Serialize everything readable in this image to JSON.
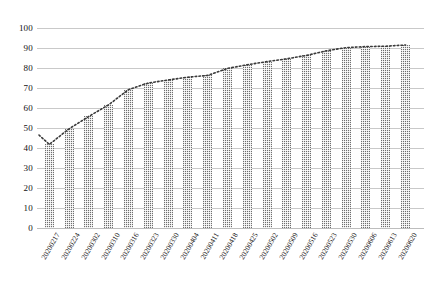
{
  "chart_data": {
    "type": "bar",
    "title": "",
    "subtitle": "",
    "xlabel": "",
    "ylabel": "",
    "ylim": [
      0,
      100
    ],
    "ytick_step": 10,
    "yticks": [
      0,
      10,
      20,
      30,
      40,
      50,
      60,
      70,
      80,
      90,
      100
    ],
    "grid": true,
    "legend": false,
    "legend_position": "none",
    "categories": [
      "20200217",
      "20200224",
      "20200302",
      "20200310",
      "20200316",
      "20200323",
      "20200330",
      "20200404",
      "20200411",
      "20200418",
      "20200425",
      "20200502",
      "20200509",
      "20200516",
      "20200523",
      "20200530",
      "20200606",
      "20200613",
      "20200620"
    ],
    "series": [
      {
        "name": "bars",
        "type": "bar",
        "values": [
          41.8,
          49.6,
          55.8,
          61.6,
          69.2,
          72.5,
          74.0,
          75.4,
          76.3,
          79.8,
          81.6,
          83.2,
          84.6,
          86.3,
          88.6,
          90.2,
          90.7,
          90.9,
          91.5
        ]
      },
      {
        "name": "trend",
        "type": "line",
        "style": "dotted",
        "values": [
          41.8,
          49.6,
          55.8,
          61.6,
          69.2,
          72.5,
          74.0,
          75.4,
          76.3,
          79.8,
          81.6,
          83.2,
          84.6,
          86.3,
          88.6,
          90.2,
          90.7,
          90.9,
          91.5
        ],
        "lead_in_value": 46.5
      }
    ],
    "colors": {
      "bar_fill": "#6e6e6e",
      "bar_pattern": "#ffffff",
      "gridline": "#c9c9c9",
      "axis_text": "#111111",
      "trend_line": "#3a3a3a",
      "background": "#ffffff"
    }
  }
}
